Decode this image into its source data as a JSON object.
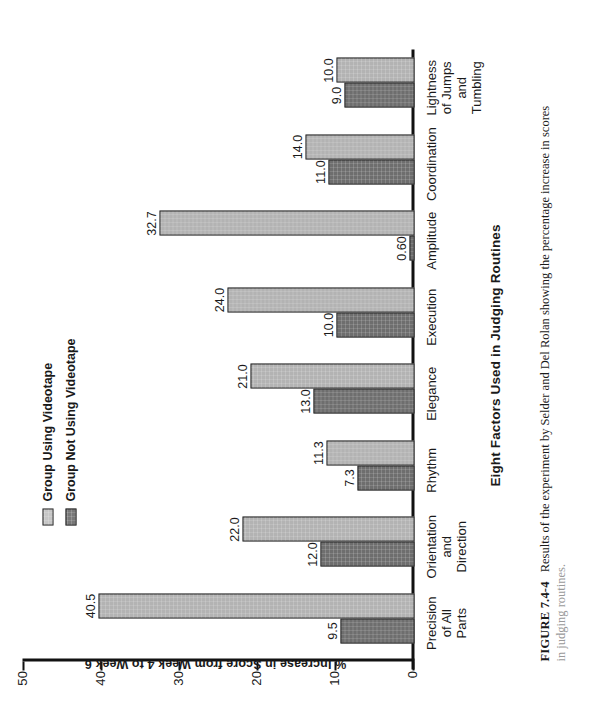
{
  "figure": {
    "number_label": "FIGURE 7.4-4",
    "caption_line1": "Results of the experiment by Selder and Del Rolan showing the percentage increase in scores",
    "caption_line2": "in judging routines."
  },
  "legend": {
    "position": "upper-left",
    "items": [
      {
        "label": "Group Using Videotape",
        "color": "#c6c6c6",
        "swatch_name": "legend-swatch-using-videotape"
      },
      {
        "label": "Group Not Using Videotape",
        "color": "#787878",
        "swatch_name": "legend-swatch-not-using-videotape"
      }
    ]
  },
  "chart_data": {
    "type": "bar",
    "title": "Eight Factors Used in Judging Routines",
    "xlabel": "Eight Factors Used in Judging Routines",
    "ylabel": "% Increase in Score from Week 4 to Week 6",
    "ylim": [
      0,
      50
    ],
    "yticks": [
      "0",
      "10",
      "20",
      "30",
      "40",
      "50"
    ],
    "grid": false,
    "orientation": "vertical-bars-on-rotated-page",
    "categories": [
      "Precision\nof All\nParts",
      "Orientation\nand Direction",
      "Rhythm",
      "Elegance",
      "Execution",
      "Amplitude",
      "Coordination",
      "Lightness\nof Jumps and\nTumbling"
    ],
    "series": [
      {
        "name": "Group Not Using Videotape",
        "color": "#6e6e6e",
        "values": [
          9.5,
          12.0,
          7.3,
          13.0,
          10.0,
          0.6,
          11.0,
          9.0
        ],
        "labels": [
          "9.5",
          "12.0",
          "7.3",
          "13.0",
          "10.0",
          "0.60",
          "11.0",
          "9.0"
        ]
      },
      {
        "name": "Group Using Videotape",
        "color": "#b3b3b3",
        "values": [
          40.5,
          22.0,
          11.3,
          21.0,
          24.0,
          32.7,
          14.0,
          10.0
        ],
        "labels": [
          "40.5",
          "22.0",
          "11.3",
          "21.0",
          "24.0",
          "32.7",
          "14.0",
          "10.0"
        ]
      }
    ]
  }
}
